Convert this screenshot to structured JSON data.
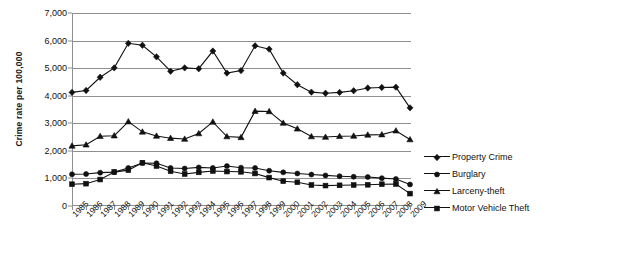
{
  "chart_data": {
    "type": "line",
    "title": "",
    "xlabel": "",
    "ylabel": "Crime rate per 100,000",
    "ylim": [
      0,
      7000
    ],
    "ytick_step": 1000,
    "grid": true,
    "legend_position": "right",
    "marker_color": "#111111",
    "line_color": "#111111",
    "grid_color": "#8f8f8f",
    "yticks": [
      "0",
      "1,000",
      "2,000",
      "3,000",
      "4,000",
      "5,000",
      "6,000",
      "7,000"
    ],
    "ytick_values": [
      0,
      1000,
      2000,
      3000,
      4000,
      5000,
      6000,
      7000
    ],
    "categories": [
      "1985",
      "1986",
      "1987",
      "1988",
      "1989",
      "1990",
      "1991",
      "1992",
      "1993",
      "1994",
      "1995",
      "1996",
      "1997",
      "1998",
      "1999",
      "2000",
      "2001",
      "2002",
      "2003",
      "2004",
      "2005",
      "2006",
      "2007",
      "2008",
      "2009"
    ],
    "series": [
      {
        "name": "Property Crime",
        "marker": "diamond",
        "values": [
          4120,
          4190,
          4670,
          5010,
          5900,
          5830,
          5410,
          4890,
          5010,
          4980,
          5620,
          4820,
          4910,
          5810,
          5690,
          4820,
          4400,
          4130,
          4090,
          4120,
          4180,
          4280,
          4300,
          4310,
          3560
        ]
      },
      {
        "name": "Burglary",
        "marker": "circle",
        "values": [
          1150,
          1160,
          1210,
          1230,
          1380,
          1560,
          1550,
          1380,
          1360,
          1400,
          1380,
          1450,
          1390,
          1380,
          1280,
          1220,
          1180,
          1140,
          1110,
          1080,
          1060,
          1050,
          1010,
          980,
          780
        ]
      },
      {
        "name": "Larceny-theft",
        "marker": "triangle",
        "values": [
          2180,
          2220,
          2530,
          2550,
          3060,
          2690,
          2540,
          2460,
          2430,
          2630,
          3050,
          2520,
          2490,
          3440,
          3430,
          3010,
          2800,
          2520,
          2500,
          2530,
          2540,
          2580,
          2590,
          2730,
          2410
        ]
      },
      {
        "name": "Motor Vehicle Theft",
        "marker": "square",
        "values": [
          790,
          810,
          960,
          1230,
          1300,
          1570,
          1450,
          1260,
          1160,
          1220,
          1270,
          1250,
          1240,
          1180,
          1030,
          900,
          860,
          760,
          740,
          750,
          760,
          770,
          790,
          800,
          450
        ]
      }
    ]
  },
  "legend": {
    "items": [
      {
        "label": "Property Crime",
        "marker": "diamond"
      },
      {
        "label": "Burglary",
        "marker": "circle"
      },
      {
        "label": "Larceny-theft",
        "marker": "triangle"
      },
      {
        "label": "Motor Vehicle Theft",
        "marker": "square"
      }
    ]
  }
}
